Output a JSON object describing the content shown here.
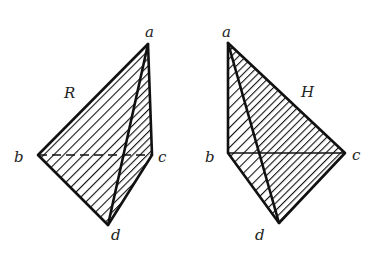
{
  "figures": [
    {
      "id": "left",
      "view_label": "R",
      "vertices": {
        "a": {
          "label": "a",
          "x": 148,
          "y": 44
        },
        "b": {
          "label": "b",
          "x": 38,
          "y": 155
        },
        "c": {
          "label": "c",
          "x": 152,
          "y": 155
        },
        "d": {
          "label": "d",
          "x": 108,
          "y": 225
        }
      },
      "hidden_edges": [
        "b-c"
      ]
    },
    {
      "id": "right",
      "view_label": "H",
      "vertices": {
        "a": {
          "label": "a",
          "x": 228,
          "y": 43
        },
        "b": {
          "label": "b",
          "x": 228,
          "y": 153
        },
        "c": {
          "label": "c",
          "x": 345,
          "y": 153
        },
        "d": {
          "label": "d",
          "x": 279,
          "y": 223
        }
      },
      "hidden_edges": []
    }
  ],
  "colors": {
    "ink": "#111111",
    "background": "#ffffff"
  }
}
